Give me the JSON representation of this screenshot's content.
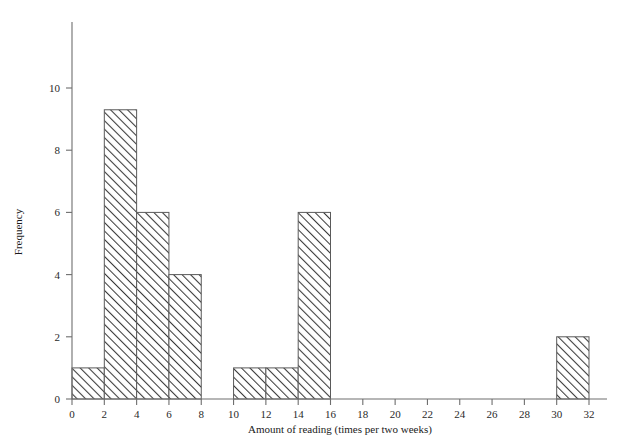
{
  "chart_data": {
    "type": "bar",
    "title": "",
    "subtitle": "",
    "xlabel": "Amount of reading (times per two weeks)",
    "ylabel": "Frequency",
    "xlim": [
      0,
      32
    ],
    "ylim": [
      0,
      11.5
    ],
    "xticks": [
      0,
      2,
      4,
      6,
      8,
      10,
      12,
      14,
      16,
      18,
      20,
      22,
      24,
      26,
      28,
      30,
      32
    ],
    "yticks": [
      0,
      2,
      4,
      6,
      8,
      10
    ],
    "grid": false,
    "legend": null,
    "bin_width": 2,
    "bins": [
      {
        "start": 0,
        "end": 2,
        "label": "0–2",
        "value": 1
      },
      {
        "start": 2,
        "end": 4,
        "label": "2–4",
        "value": 9.3
      },
      {
        "start": 4,
        "end": 6,
        "label": "4–6",
        "value": 6
      },
      {
        "start": 6,
        "end": 8,
        "label": "6–8",
        "value": 4
      },
      {
        "start": 8,
        "end": 10,
        "label": "8–10",
        "value": 0
      },
      {
        "start": 10,
        "end": 12,
        "label": "10–12",
        "value": 1
      },
      {
        "start": 12,
        "end": 14,
        "label": "12–14",
        "value": 1
      },
      {
        "start": 14,
        "end": 16,
        "label": "14–16",
        "value": 6
      },
      {
        "start": 16,
        "end": 18,
        "label": "16–18",
        "value": 0
      },
      {
        "start": 18,
        "end": 20,
        "label": "18–20",
        "value": 0
      },
      {
        "start": 20,
        "end": 22,
        "label": "20–22",
        "value": 0
      },
      {
        "start": 22,
        "end": 24,
        "label": "22–24",
        "value": 0
      },
      {
        "start": 24,
        "end": 26,
        "label": "24–26",
        "value": 0
      },
      {
        "start": 26,
        "end": 28,
        "label": "26–28",
        "value": 0
      },
      {
        "start": 28,
        "end": 30,
        "label": "28–30",
        "value": 0
      },
      {
        "start": 30,
        "end": 32,
        "label": "30–32",
        "value": 2
      }
    ],
    "categories": [
      "0–2",
      "2–4",
      "4–6",
      "6–8",
      "8–10",
      "10–12",
      "12–14",
      "14–16",
      "16–18",
      "18–20",
      "20–22",
      "22–24",
      "24–26",
      "26–28",
      "28–30",
      "30–32"
    ],
    "values": [
      1,
      9.3,
      6,
      4,
      0,
      1,
      1,
      6,
      0,
      0,
      0,
      0,
      0,
      0,
      0,
      2
    ]
  },
  "style": {
    "bar_fill": "#ffffff",
    "bar_hatch": "diagonal-forward",
    "bar_hatch_color": "#3a3a3a",
    "bar_border": "#5a5a5a",
    "axis_color": "#6e6e6e",
    "text_color": "#1a1a1a",
    "background": "#ffffff"
  },
  "geometry": {
    "x0_px": 72,
    "x32_px": 589,
    "y0_px": 399,
    "ytop_px": 22,
    "y_unit_px": 31.1
  }
}
